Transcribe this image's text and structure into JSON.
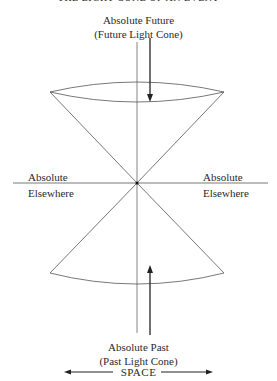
{
  "diagram": {
    "title": "THE LIGHT CONE OF AN EVENT",
    "future": {
      "label": "Absolute Future",
      "sublabel": "(Future Light Cone)"
    },
    "past": {
      "label": "Absolute Past",
      "sublabel": "(Past Light Cone)"
    },
    "elsewhere_left": {
      "line1": "Absolute",
      "line2": "Elsewhere"
    },
    "elsewhere_right": {
      "line1": "Absolute",
      "line2": "Elsewhere"
    },
    "space_axis_label": "SPACE",
    "colors": {
      "line": "#555555",
      "arrow": "#222222",
      "text": "#2a2a2a",
      "background": "#ffffff"
    }
  }
}
